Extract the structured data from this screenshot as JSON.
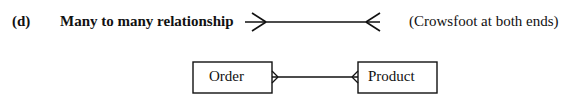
{
  "item_marker": "(d)",
  "heading": "Many to many relationship",
  "note": "(Crowsfoot at both ends)",
  "diagram": {
    "entities": [
      {
        "name": "Order"
      },
      {
        "name": "Product"
      }
    ],
    "relationship": "many-to-many",
    "notation": "crowsfoot"
  }
}
